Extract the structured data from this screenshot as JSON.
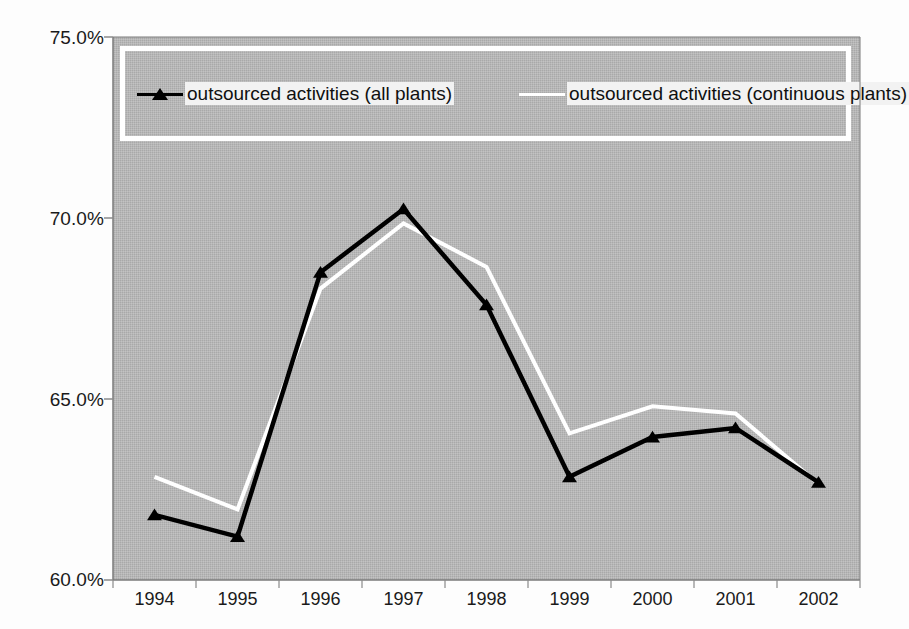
{
  "chart_data": {
    "type": "line",
    "title": "",
    "subtitle": "",
    "xlabel": "",
    "ylabel": "",
    "categories": [
      "1994",
      "1995",
      "1996",
      "1997",
      "1998",
      "1999",
      "2000",
      "2001",
      "2002"
    ],
    "ylim": [
      60.0,
      75.0
    ],
    "ytick_values": [
      60.0,
      65.0,
      70.0,
      75.0
    ],
    "ytick_labels": [
      "60.0%",
      "65.0%",
      "70.0%",
      "75.0%"
    ],
    "grid": false,
    "legend_position": "top-inside",
    "units": "percent",
    "series": [
      {
        "name": "outsourced activities (all plants)",
        "color": "#000000",
        "marker": "triangle",
        "values": [
          61.8,
          61.2,
          68.5,
          70.25,
          67.6,
          62.85,
          63.95,
          64.2,
          62.7
        ]
      },
      {
        "name": "outsourced activities (continuous plants)",
        "color": "#ffffff",
        "marker": "none",
        "values": [
          62.85,
          61.95,
          68.05,
          69.85,
          68.65,
          64.05,
          64.8,
          64.6,
          62.65
        ]
      }
    ]
  },
  "plot": {
    "background_color": "#a9a9a9",
    "page_background_color": "#fdfdfd",
    "axis_color": "#7a7a7a",
    "tick_color": "#8a8a8a"
  },
  "legend": {
    "border_color": "#ffffff",
    "entries": [
      {
        "label": "outsourced activities (all plants)",
        "color": "#000000",
        "marker": "triangle"
      },
      {
        "label": "outsourced activities (continuous plants)",
        "color": "#ffffff",
        "marker": "none"
      }
    ]
  }
}
